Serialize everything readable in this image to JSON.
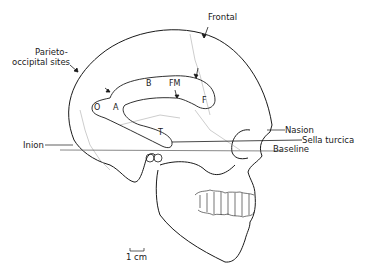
{
  "figure": {
    "type": "lateral skull diagram",
    "labels": {
      "frontal": "Frontal",
      "parieto_occipital": [
        "Parieto-",
        "occipital sites"
      ],
      "nasion": "Nasion",
      "sella_turcica": "Sella turcica",
      "baseline": "Baseline",
      "inion": "Inion"
    },
    "regions": {
      "B": "B",
      "FM": "FM",
      "F": "F",
      "A": "A",
      "O": "O",
      "T": "T"
    },
    "scale_bar": "1 cm",
    "colors": {
      "line": "#1a1a1a",
      "suture": "#9a9a9a",
      "background": "#ffffff"
    }
  }
}
